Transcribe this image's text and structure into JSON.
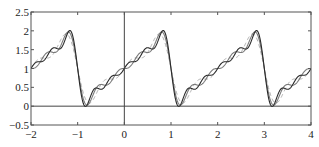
{
  "chart_data": {
    "type": "line",
    "title": "",
    "xlabel": "",
    "ylabel": "",
    "xlim": [
      -2,
      4
    ],
    "ylim": [
      -0.5,
      2.5
    ],
    "grid": false,
    "legend": null,
    "xticks": [
      -2,
      -1,
      0,
      1,
      2,
      3,
      4
    ],
    "xtick_labels": [
      "−2",
      "−1",
      "0",
      "1",
      "2",
      "3",
      "4"
    ],
    "yticks": [
      -0.5,
      0,
      0.5,
      1,
      1.5,
      2,
      2.5
    ],
    "ytick_labels": [
      "−0.5",
      "0",
      "0.5",
      "1",
      "1.5",
      "2",
      "2.5"
    ],
    "reference_lines": [
      {
        "orientation": "vertical",
        "x": 0
      },
      {
        "orientation": "horizontal",
        "y": 0
      }
    ],
    "series": [
      {
        "name": "partial sum N=3",
        "terms": 3,
        "style": "dashed",
        "color": "#b0b0b0"
      },
      {
        "name": "partial sum N=4",
        "terms": 4,
        "style": "solid",
        "color": "#7a7a7a"
      },
      {
        "name": "partial sum N=5",
        "terms": 5,
        "style": "solid",
        "color": "#2a2a2a"
      }
    ],
    "sample_points": {
      "x": [
        -2,
        -1.5,
        -1.2,
        -1,
        -0.8,
        -0.5,
        0,
        0.5,
        0.8,
        1,
        1.2,
        1.5,
        2,
        2.5,
        2.8,
        3,
        3.2,
        3.5,
        4
      ],
      "y_approx": [
        1,
        1.45,
        1.95,
        1,
        0.05,
        0.55,
        1,
        1.45,
        1.95,
        1,
        0.05,
        0.55,
        1,
        1.45,
        1.95,
        1,
        0.05,
        0.55,
        1
      ]
    }
  },
  "plot_area": {
    "left": 31,
    "top": 12,
    "right": 311,
    "bottom": 125
  }
}
